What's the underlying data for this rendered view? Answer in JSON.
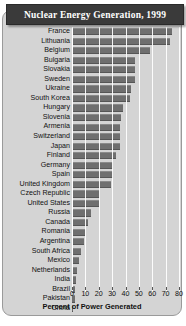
{
  "figure": {
    "title": "Nuclear Energy Generation, 1999"
  },
  "chart_data": {
    "type": "bar",
    "orientation": "horizontal",
    "title": "Nuclear Energy Generation, 1999",
    "xlabel": "Percent of Power Generated",
    "ylabel": "",
    "xlim": [
      0,
      80
    ],
    "xticks": [
      0,
      10,
      20,
      30,
      40,
      50,
      60,
      70,
      80
    ],
    "xtick_labels": [
      "0",
      "10",
      "20",
      "30",
      "40",
      "50",
      "60",
      "70",
      "80"
    ],
    "grid": true,
    "legend": false,
    "bar_color": "#6f6f6f",
    "categories": [
      "France",
      "Lithuania",
      "Belgium",
      "Bulgaria",
      "Slovakia",
      "Sweden",
      "Ukraine",
      "South Korea",
      "Hungary",
      "Slovenia",
      "Armenia",
      "Switzerland",
      "Japan",
      "Finland",
      "Germany",
      "Spain",
      "United Kingdom",
      "Czech Republic",
      "United States",
      "Russia",
      "Canada",
      "Romania",
      "Argentina",
      "South Africa",
      "Mexico",
      "Netherlands",
      "India",
      "Brazil",
      "Pakistan",
      "China"
    ],
    "values": [
      75,
      73,
      58,
      47,
      47,
      47,
      44,
      43,
      38,
      37,
      36,
      36,
      36,
      33,
      31,
      31,
      29,
      21,
      20,
      14,
      12,
      10,
      9,
      7,
      5,
      4,
      3,
      2,
      2,
      1
    ]
  }
}
